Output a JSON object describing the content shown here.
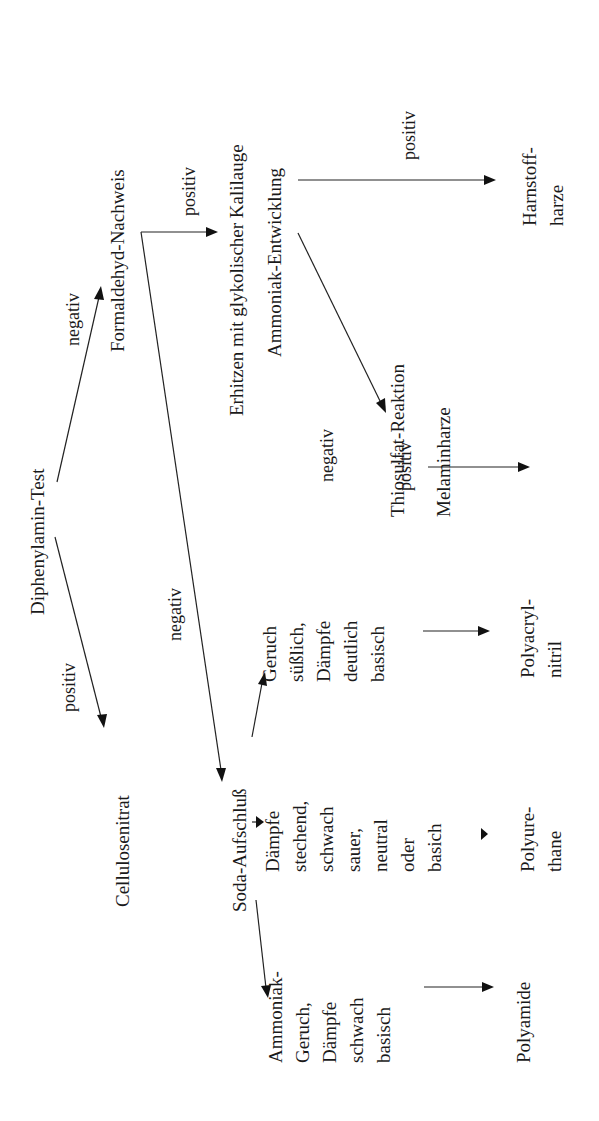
{
  "diagram": {
    "orientation": "rotated -90deg (text reads bottom-to-top)",
    "nodes": {
      "diphenylamin": "Diphenylamin-Test",
      "cellulosenitrat": "Cellulosenitrat",
      "formaldehyd": "Formaldehyd-Nachweis",
      "erhitzen": "Erhitzen mit glykolischer Kalilauge",
      "ammoniak_entwicklung": "Ammoniak-Entwicklung",
      "harnstoffharze": [
        "Harnstoff-",
        "harze"
      ],
      "thiosulfat": "Thiosulfat-Reaktion",
      "melaminharze": "Melaminharze",
      "soda": "Soda-Aufschluß",
      "geruch_suesslich": [
        "Geruch",
        "süßlich,",
        "Dämpfe",
        "deutlich",
        "basisch"
      ],
      "daempfe_stechend": [
        "Dämpfe",
        "stechend,",
        "schwach",
        "sauer,",
        "neutral",
        "oder",
        "basich"
      ],
      "ammoniak_geruch": [
        "Ammoniak-",
        "Geruch,",
        "Dämpfe",
        "schwach",
        "basisch"
      ],
      "polyacrylnitril": [
        "Polyacryl-",
        "nitril"
      ],
      "polyurethane": [
        "Polyure-",
        "thane"
      ],
      "polyamide": "Polyamide"
    },
    "edge_labels": {
      "diph_pos": "positiv",
      "diph_neg": "negativ",
      "form_pos": "positiv",
      "form_neg": "negativ",
      "amm_pos": "positiv",
      "amm_neg": "negativ",
      "thio_pos": "positiv"
    },
    "edges": [
      {
        "from": "Diphenylamin-Test",
        "to": "Cellulosenitrat",
        "label": "positiv"
      },
      {
        "from": "Diphenylamin-Test",
        "to": "Formaldehyd-Nachweis",
        "label": "negativ"
      },
      {
        "from": "Formaldehyd-Nachweis",
        "to": "Erhitzen mit glykolischer Kalilauge",
        "label": "positiv"
      },
      {
        "from": "Formaldehyd-Nachweis",
        "to": "Soda-Aufschluß",
        "label": "negativ"
      },
      {
        "from": "Ammoniak-Entwicklung",
        "to": "Harnstoffharze",
        "label": "positiv"
      },
      {
        "from": "Ammoniak-Entwicklung",
        "to": "Thiosulfat-Reaktion",
        "label": "negativ"
      },
      {
        "from": "Thiosulfat-Reaktion",
        "to": "Melaminharze",
        "label": "positiv"
      },
      {
        "from": "Soda-Aufschluß",
        "to": "Geruch süßlich, Dämpfe deutlich basisch",
        "label": ""
      },
      {
        "from": "Soda-Aufschluß",
        "to": "Dämpfe stechend, schwach sauer, neutral oder basich",
        "label": ""
      },
      {
        "from": "Soda-Aufschluß",
        "to": "Ammoniak-Geruch, Dämpfe schwach basisch",
        "label": ""
      },
      {
        "from": "Geruch süßlich, Dämpfe deutlich basisch",
        "to": "Polyacrylnitril",
        "label": ""
      },
      {
        "from": "Dämpfe stechend, schwach sauer, neutral oder basich",
        "to": "Polyurethane",
        "label": ""
      },
      {
        "from": "Ammoniak-Geruch, Dämpfe schwach basisch",
        "to": "Polyamide",
        "label": ""
      }
    ]
  }
}
